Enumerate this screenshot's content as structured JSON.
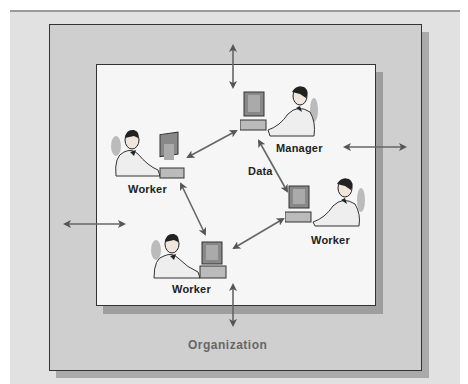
{
  "diagram": {
    "caption": "",
    "organization_label": "Organization",
    "data_label": "Data",
    "nodes": [
      {
        "id": "worker-left",
        "label": "Worker",
        "role": "worker"
      },
      {
        "id": "manager",
        "label": "Manager",
        "role": "manager"
      },
      {
        "id": "worker-right",
        "label": "Worker",
        "role": "worker"
      },
      {
        "id": "worker-bottom",
        "label": "Worker",
        "role": "worker"
      }
    ],
    "connections": [
      {
        "from": "worker-left",
        "to": "manager",
        "type": "bidirectional"
      },
      {
        "from": "manager",
        "to": "worker-right",
        "type": "bidirectional",
        "label": "Data"
      },
      {
        "from": "worker-left",
        "to": "worker-bottom",
        "type": "bidirectional"
      },
      {
        "from": "worker-bottom",
        "to": "worker-right",
        "type": "bidirectional"
      },
      {
        "from": "system",
        "to": "organization",
        "type": "bidirectional",
        "position": "top"
      },
      {
        "from": "system",
        "to": "organization",
        "type": "bidirectional",
        "position": "bottom"
      },
      {
        "from": "system",
        "to": "organization",
        "type": "bidirectional",
        "position": "left"
      },
      {
        "from": "system",
        "to": "organization",
        "type": "bidirectional",
        "position": "right"
      }
    ],
    "colors": {
      "outer_background": "#e1e1e1",
      "organization_box": "#cfcfcf",
      "system_box": "#f6f6f6",
      "arrow": "#555555"
    }
  }
}
